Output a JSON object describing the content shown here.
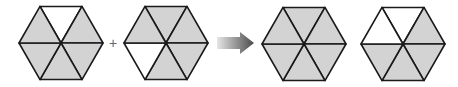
{
  "colors": {
    "shaded": "#d3d3d3",
    "empty": "#ffffff",
    "stroke": "#1a1a1a",
    "arrow_light": "#e0e0e0",
    "arrow_dark": "#555555"
  },
  "operator": "+",
  "hexagons": [
    {
      "id": "hex-1",
      "cx": 61,
      "cy": 43,
      "r": 42,
      "shaded": [
        false,
        true,
        true,
        true,
        true,
        true
      ]
    },
    {
      "id": "hex-2",
      "cx": 166,
      "cy": 43,
      "r": 42,
      "shaded": [
        true,
        true,
        true,
        true,
        false,
        true
      ]
    },
    {
      "id": "hex-3",
      "cx": 304,
      "cy": 44,
      "r": 42,
      "shaded": [
        true,
        true,
        true,
        true,
        true,
        true
      ]
    },
    {
      "id": "hex-4",
      "cx": 403,
      "cy": 44,
      "r": 42,
      "shaded": [
        false,
        true,
        true,
        true,
        true,
        false
      ]
    }
  ],
  "triangle_order": [
    "top",
    "upper-right",
    "lower-right",
    "bottom",
    "lower-left",
    "upper-left"
  ]
}
